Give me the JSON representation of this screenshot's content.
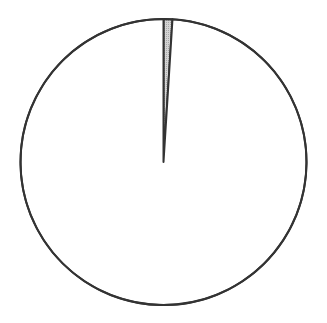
{
  "chart_data": {
    "type": "pie",
    "title": "",
    "labels": [
      "Slice A",
      "Slice B"
    ],
    "values": [
      1,
      99
    ],
    "colors": [
      "#c8c8c8",
      "#ffffff"
    ],
    "start_angle_deg": 0,
    "direction": "clockwise",
    "stroke_color": "#333333",
    "legend": "none"
  },
  "layout": {
    "cx": 163.5,
    "cy": 162,
    "r": 143
  }
}
